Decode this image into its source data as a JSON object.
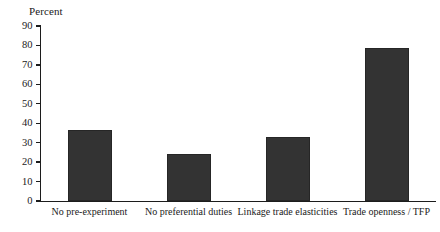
{
  "chart_data": {
    "type": "bar",
    "title": "",
    "axis_title": "Percent",
    "xlabel": "",
    "ylabel": "Percent",
    "categories": [
      "No pre-experiment",
      "No preferential duties",
      "Linkage trade elasticities",
      "Trade openness / TFP"
    ],
    "values": [
      36.5,
      24,
      33,
      78.5
    ],
    "ylim": [
      0,
      90
    ],
    "yticks": [
      0,
      10,
      20,
      30,
      40,
      50,
      60,
      70,
      80,
      90
    ],
    "ytick_labels": [
      "0",
      "10",
      "20",
      "30",
      "40",
      "50",
      "60",
      "70",
      "80",
      "90"
    ],
    "grid": false,
    "legend": null,
    "bar_color": "#333333",
    "axis_color": "#1c1c1c",
    "background": "#ffffff"
  }
}
